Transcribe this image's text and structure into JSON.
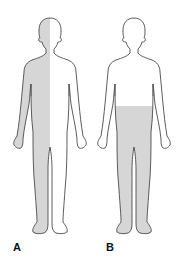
{
  "colors": {
    "outline": "#4a4a4a",
    "shade": "#d6d6d6",
    "background": "#ffffff"
  },
  "figures": [
    {
      "label": "A",
      "description": "Body outline with the left half (viewer's left) shaded, head to feet",
      "shaded_region": "left-half"
    },
    {
      "label": "B",
      "description": "Body outline with the lower body shaded from waist to feet",
      "shaded_region": "waist-down"
    }
  ]
}
